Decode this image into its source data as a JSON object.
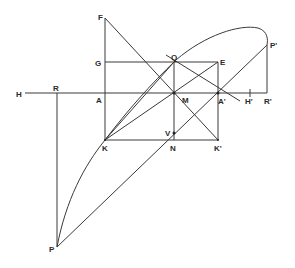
{
  "diagram": {
    "type": "geometric-construction",
    "labels": {
      "F": "F",
      "G": "G",
      "Q": "Q",
      "E": "E",
      "H": "H",
      "R": "R",
      "A": "A",
      "M": "M",
      "A_prime": "A'",
      "H_prime": "H'",
      "R_prime": "R'",
      "P_prime": "P'",
      "K": "K",
      "N": "N",
      "K_prime": "K'",
      "V": "V",
      "P": "P"
    },
    "points": {
      "F": [
        105,
        18
      ],
      "G": [
        105,
        62
      ],
      "Q": [
        174,
        62
      ],
      "E": [
        218,
        62
      ],
      "H": [
        25,
        93
      ],
      "R": [
        57,
        93
      ],
      "A": [
        105,
        93
      ],
      "M": [
        174,
        93
      ],
      "A_prime": [
        218,
        93
      ],
      "H_prime": [
        250,
        93
      ],
      "R_prime": [
        267,
        93
      ],
      "P_prime": [
        267,
        45
      ],
      "K": [
        105,
        140
      ],
      "N": [
        174,
        140
      ],
      "K_prime": [
        218,
        140
      ],
      "V": [
        174,
        133
      ],
      "P": [
        57,
        247
      ]
    },
    "line_color": "#3a3a3a"
  }
}
